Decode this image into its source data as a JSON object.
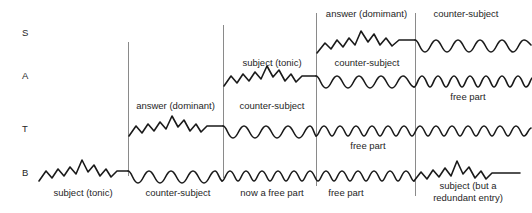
{
  "diagram": {
    "ink_color": "#1a1a1a",
    "divider_color": "#8a8a8a",
    "background": "#ffffff",
    "voices": [
      {
        "id": "S",
        "label": "S",
        "name": "soprano",
        "x": 22,
        "y": 27
      },
      {
        "id": "A",
        "label": "A",
        "name": "alto",
        "x": 22,
        "y": 70
      },
      {
        "id": "T",
        "label": "T",
        "name": "tenor",
        "x": 22,
        "y": 123
      },
      {
        "id": "B",
        "label": "B",
        "name": "bass",
        "x": 22,
        "y": 167
      }
    ],
    "dividers": [
      {
        "name": "divider-1",
        "x": 128,
        "y1": 42,
        "y2": 176
      },
      {
        "name": "divider-2",
        "x": 223,
        "y1": 25,
        "y2": 178
      },
      {
        "name": "divider-3",
        "x": 316,
        "y1": 13,
        "y2": 186
      },
      {
        "name": "divider-4",
        "x": 415,
        "y1": 13,
        "y2": 196
      }
    ],
    "annotations": [
      {
        "name": "label-b-subject-tonic",
        "text": "subject (tonic)",
        "x": 38,
        "y": 187,
        "w": 90,
        "voice": "B"
      },
      {
        "name": "label-t-answer-dominant",
        "text": "answer (dominant)",
        "x": 128,
        "y": 100,
        "w": 95,
        "voice": "T"
      },
      {
        "name": "label-b-counter-subject",
        "text": "counter-subject",
        "x": 133,
        "y": 187,
        "w": 90,
        "voice": "B"
      },
      {
        "name": "label-a-subject-tonic",
        "text": "subject (tonic)",
        "x": 228,
        "y": 57,
        "w": 88,
        "voice": "A"
      },
      {
        "name": "label-t-counter-subject",
        "text": "counter-subject",
        "x": 228,
        "y": 100,
        "w": 88,
        "voice": "T"
      },
      {
        "name": "label-b-now-a-free-part",
        "text": "now a free part",
        "x": 228,
        "y": 187,
        "w": 88,
        "voice": "B"
      },
      {
        "name": "label-s-answer-domimant",
        "text": "answer (domimant)",
        "x": 318,
        "y": 8,
        "w": 97,
        "voice": "S"
      },
      {
        "name": "label-a-counter-subject",
        "text": "counter-subject",
        "x": 322,
        "y": 57,
        "w": 90,
        "voice": "A"
      },
      {
        "name": "label-t-free-part",
        "text": "free part",
        "x": 340,
        "y": 140,
        "w": 56,
        "voice": "T"
      },
      {
        "name": "label-b-free-part",
        "text": "free part",
        "x": 318,
        "y": 187,
        "w": 56,
        "voice": "B"
      },
      {
        "name": "label-s-counter-subject",
        "text": "counter-subject",
        "x": 420,
        "y": 8,
        "w": 92,
        "voice": "S"
      },
      {
        "name": "label-a-free-part",
        "text": "free part",
        "x": 440,
        "y": 91,
        "w": 56,
        "voice": "A"
      },
      {
        "name": "label-b-subject-redundant-1",
        "text": "subject (but a",
        "x": 420,
        "y": 180,
        "w": 96,
        "voice": "B"
      },
      {
        "name": "label-b-subject-redundant-2",
        "text": "redundant entry)",
        "x": 420,
        "y": 192,
        "w": 96,
        "voice": "B"
      }
    ],
    "staves": [
      {
        "id": "S",
        "baseline": 45,
        "segments": [
          {
            "from": 316,
            "to": 415,
            "motif": "subject-zigzag",
            "label": "answer (domimant)"
          },
          {
            "from": 415,
            "to": 532,
            "motif": "counter-wave-broad",
            "label": "counter-subject"
          }
        ]
      },
      {
        "id": "A",
        "baseline": 78,
        "segments": [
          {
            "from": 223,
            "to": 316,
            "motif": "subject-zigzag",
            "label": "subject (tonic)"
          },
          {
            "from": 316,
            "to": 415,
            "motif": "counter-wave-broad",
            "label": "counter-subject"
          },
          {
            "from": 415,
            "to": 532,
            "motif": "free-wave-fast",
            "label": "free part"
          }
        ]
      },
      {
        "id": "T",
        "baseline": 128,
        "segments": [
          {
            "from": 128,
            "to": 223,
            "motif": "subject-zigzag",
            "label": "answer (dominant)"
          },
          {
            "from": 223,
            "to": 316,
            "motif": "counter-wave-broad",
            "label": "counter-subject"
          },
          {
            "from": 316,
            "to": 532,
            "motif": "free-wave-fast",
            "label": "free part"
          }
        ]
      },
      {
        "id": "B",
        "baseline": 172,
        "segments": [
          {
            "from": 38,
            "to": 128,
            "motif": "subject-zigzag",
            "label": "subject (tonic)"
          },
          {
            "from": 128,
            "to": 223,
            "motif": "counter-wave-broad",
            "label": "counter-subject"
          },
          {
            "from": 223,
            "to": 415,
            "motif": "free-wave-fast",
            "label": "now a free part / free part"
          },
          {
            "from": 415,
            "to": 520,
            "motif": "subject-zigzag",
            "label": "subject (but a redundant entry)"
          }
        ]
      }
    ]
  }
}
